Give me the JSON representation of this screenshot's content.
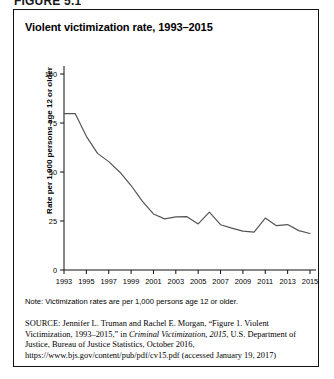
{
  "figure_caption": "FIGURE 5.1",
  "chart_title": "Violent victimization rate, 1993–2015",
  "note": "Note: Victimization rates are per 1,000 persons age 12 or older.",
  "source": {
    "label": "SOURCE:",
    "text": " Jennifer L. Truman and Rachel E. Morgan, “Figure 1. Violent Victimization, 1993–2015,” in ",
    "italic_title": "Criminal Victimization, 2015",
    "text_after": ", U.S. Department of Justice, Bureau of Justice Statistics, October 2016, https://www.bjs.gov/content/pub/pdf/cv15.pdf (accessed January 19, 2017)"
  },
  "colors": {
    "line": "#555555",
    "axis": "#111111",
    "border": "#111111",
    "background": "#ffffff"
  },
  "chart_data": {
    "type": "line",
    "title": "Violent victimization rate, 1993–2015",
    "xlabel": "",
    "ylabel": "Rate per 1,000 persons age 12 or older",
    "ylim": [
      0,
      100
    ],
    "yticks": [
      0,
      25,
      50,
      75,
      100
    ],
    "ytick_labels": [
      "0",
      "25",
      "50",
      "75",
      "100"
    ],
    "xlim": [
      1993,
      2015
    ],
    "xticks": [
      1993,
      1995,
      1997,
      1999,
      2001,
      2003,
      2005,
      2007,
      2009,
      2011,
      2013,
      2015
    ],
    "xtick_labels": [
      "1993",
      "1995",
      "1997",
      "1999",
      "2001",
      "2003",
      "2005",
      "2007",
      "2009",
      "2011",
      "2013",
      "2015"
    ],
    "grid": false,
    "legend": null,
    "x": [
      1993,
      1994,
      1995,
      1996,
      1997,
      1998,
      1999,
      2000,
      2001,
      2002,
      2003,
      2004,
      2005,
      2006,
      2007,
      2008,
      2009,
      2010,
      2011,
      2012,
      2013,
      2014,
      2015
    ],
    "series": [
      {
        "name": "Violent victimization rate",
        "values": [
          79.8,
          79.8,
          68.2,
          59.5,
          55.3,
          49.9,
          43.1,
          35.1,
          28.6,
          26.1,
          27.1,
          27.2,
          23.5,
          29.5,
          23.1,
          21.4,
          19.8,
          19.3,
          26.5,
          22.6,
          23.2,
          20.1,
          18.6
        ]
      }
    ]
  }
}
